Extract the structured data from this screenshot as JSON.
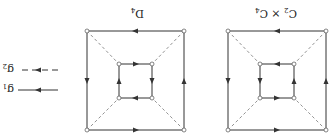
{
  "orientation": "rotated-180",
  "legend": {
    "items": [
      {
        "label": "g",
        "sub": "1",
        "style": "solid"
      },
      {
        "label": "g",
        "sub": "2",
        "style": "dashed"
      }
    ]
  },
  "graphs": [
    {
      "title": "D",
      "title_sub": "4",
      "name": "D4 Cayley graph"
    },
    {
      "title": "C",
      "title_sub": "2",
      "title_mid": " × C",
      "title_sub2": "4",
      "name": "C2 x C4 Cayley graph"
    }
  ],
  "colors": {
    "stroke": "#333333",
    "dashed": "#777777",
    "vertex_fill": "#ffffff"
  }
}
